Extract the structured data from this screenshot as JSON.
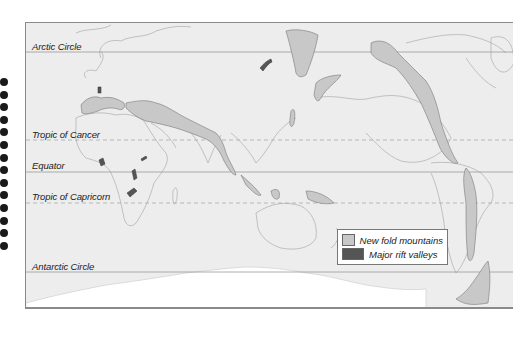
{
  "map": {
    "title": "",
    "latitude_lines": [
      {
        "id": "arctic",
        "label": "Arctic Circle",
        "style": "solid"
      },
      {
        "id": "cancer",
        "label": "Tropic of Cancer",
        "style": "dashed"
      },
      {
        "id": "equator",
        "label": "Equator",
        "style": "solid"
      },
      {
        "id": "capricorn",
        "label": "Tropic of Capricorn",
        "style": "dashed"
      },
      {
        "id": "antarctic",
        "label": "Antarctic Circle",
        "style": "solid"
      }
    ],
    "legend": {
      "items": [
        {
          "label": "New fold mountains",
          "color": "#c8c8c8"
        },
        {
          "label": "Major rift valleys",
          "color": "#555555"
        }
      ]
    },
    "colors": {
      "ocean": "#ededed",
      "land_outline": "#b4b4b4",
      "fold_mountains": "#c8c8c8",
      "rift_valleys": "#555555",
      "antarctica": "#ffffff"
    },
    "features": {
      "fold_mountains": [
        "Alps / Mediterranean",
        "Himalayas / Asia",
        "Kamchatka / East Asia",
        "Japan",
        "Indonesia",
        "New Guinea",
        "Rockies / Western Cordillera",
        "Andes",
        "Antarctic Peninsula"
      ],
      "rift_valleys": [
        "Rhine rift",
        "Baikal rift",
        "West Africa",
        "East African Rift"
      ]
    }
  },
  "binding": {
    "ring_count": 14
  }
}
